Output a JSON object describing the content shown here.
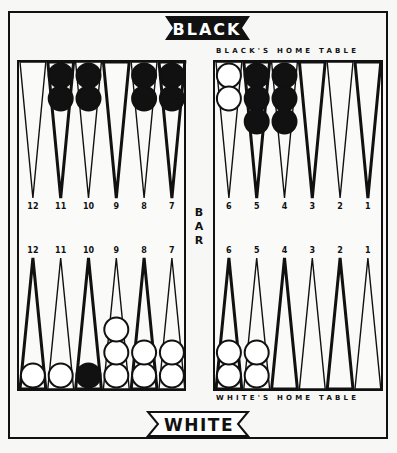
{
  "labels": {
    "top_banner": "BLACK",
    "bottom_banner": "WHITE",
    "black_home": "BLACK'S HOME TABLE",
    "white_home": "WHITE'S HOME TABLE",
    "bar": "BAR",
    "bar_chars": [
      "B",
      "A",
      "R"
    ]
  },
  "colors": {
    "ink": "#111111",
    "paper": "#fafaf8",
    "white_checker": "#ffffff",
    "black_checker": "#111111"
  },
  "points": {
    "top_left": [
      "12",
      "11",
      "10",
      "9",
      "8",
      "7"
    ],
    "top_right": [
      "6",
      "5",
      "4",
      "3",
      "2",
      "1"
    ],
    "bottom_left": [
      "12",
      "11",
      "10",
      "9",
      "8",
      "7"
    ],
    "bottom_right": [
      "6",
      "5",
      "4",
      "3",
      "2",
      "1"
    ]
  },
  "checkers": {
    "top_left": [
      {
        "point": "12",
        "color": "none",
        "count": 0
      },
      {
        "point": "11",
        "color": "black",
        "count": 2
      },
      {
        "point": "10",
        "color": "black",
        "count": 2
      },
      {
        "point": "9",
        "color": "none",
        "count": 0
      },
      {
        "point": "8",
        "color": "black",
        "count": 2
      },
      {
        "point": "7",
        "color": "black",
        "count": 2
      }
    ],
    "top_right": [
      {
        "point": "6",
        "color": "white",
        "count": 2
      },
      {
        "point": "5",
        "color": "black",
        "count": 3
      },
      {
        "point": "4",
        "color": "black",
        "count": 3
      },
      {
        "point": "3",
        "color": "none",
        "count": 0
      },
      {
        "point": "2",
        "color": "none",
        "count": 0
      },
      {
        "point": "1",
        "color": "none",
        "count": 0
      }
    ],
    "bottom_left": [
      {
        "point": "12",
        "color": "white",
        "count": 1
      },
      {
        "point": "11",
        "color": "white",
        "count": 1
      },
      {
        "point": "10",
        "color": "black",
        "count": 1
      },
      {
        "point": "9",
        "color": "white",
        "count": 3
      },
      {
        "point": "8",
        "color": "white",
        "count": 2
      },
      {
        "point": "7",
        "color": "white",
        "count": 2
      }
    ],
    "bottom_right": [
      {
        "point": "6",
        "color": "white",
        "count": 2
      },
      {
        "point": "5",
        "color": "white",
        "count": 2
      },
      {
        "point": "4",
        "color": "none",
        "count": 0
      },
      {
        "point": "3",
        "color": "none",
        "count": 0
      },
      {
        "point": "2",
        "color": "none",
        "count": 0
      },
      {
        "point": "1",
        "color": "none",
        "count": 0
      }
    ]
  }
}
